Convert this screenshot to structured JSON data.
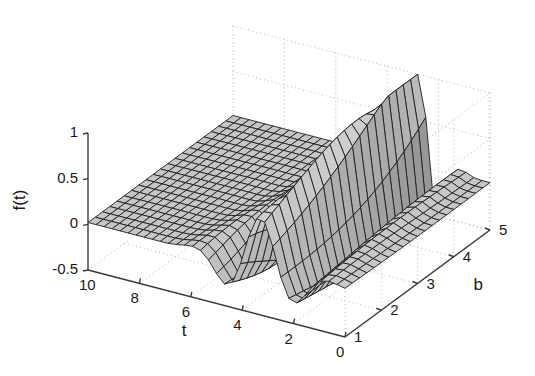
{
  "figure": {
    "background_color": "#ffffff",
    "axis_color": "#3a3a3a",
    "grid_color": "#b4b4b4",
    "mesh_line_color": "#1e1e1e",
    "surface_face_light": "#c9c9c9",
    "surface_face_mid": "#7d7d7d",
    "surface_face_dark": "#4a4a4a"
  },
  "chart_data": {
    "type": "surface",
    "title": "",
    "xlabel": "t",
    "ylabel": "b",
    "zlabel": "f(t)",
    "grid": true,
    "legend": "none",
    "xlim": [
      0,
      10
    ],
    "ylim": [
      1,
      5
    ],
    "zlim": [
      -0.5,
      1
    ],
    "xticks": [
      10,
      8,
      6,
      4,
      2,
      0
    ],
    "xtick_labels": [
      "10",
      "8",
      "6",
      "4",
      "2",
      "0"
    ],
    "yticks": [
      1,
      2,
      3,
      4,
      5
    ],
    "ytick_labels": [
      "1",
      "2",
      "3",
      "4",
      "5"
    ],
    "zticks": [
      -0.5,
      0,
      0.5,
      1
    ],
    "ztick_labels": [
      "-0.5",
      "0",
      "0.5",
      "1"
    ],
    "x_axis_direction": "descending_left_to_right",
    "y_axis_direction": "ascending_front_to_back_right",
    "mesh_nx": 33,
    "mesh_ny": 21,
    "model": {
      "kind": "morlet_like_wavelet",
      "plateau_level": 0.02,
      "center_t_base": 3.3,
      "center_t_slope": -0.12,
      "width_base": 1.25,
      "width_slope": -0.13,
      "amp_base": 0.55,
      "amp_slope": 0.16,
      "freq_base": 2.1,
      "freq_slope": 0.3,
      "phase": 0.0,
      "peak_max": 1.0,
      "trough_min": -0.5
    }
  },
  "axes": {
    "z_ticks": [
      {
        "label": "1",
        "value": 1.0
      },
      {
        "label": "0.5",
        "value": 0.5
      },
      {
        "label": "0",
        "value": 0.0
      },
      {
        "label": "-0.5",
        "value": -0.5
      }
    ],
    "t_ticks": [
      {
        "label": "10",
        "value": 10
      },
      {
        "label": "8",
        "value": 8
      },
      {
        "label": "6",
        "value": 6
      },
      {
        "label": "4",
        "value": 4
      },
      {
        "label": "2",
        "value": 2
      },
      {
        "label": "0",
        "value": 0
      }
    ],
    "b_ticks": [
      {
        "label": "1",
        "value": 1
      },
      {
        "label": "2",
        "value": 2
      },
      {
        "label": "3",
        "value": 3
      },
      {
        "label": "4",
        "value": 4
      },
      {
        "label": "5",
        "value": 5
      }
    ],
    "t_axis_label": "t",
    "b_axis_label": "b",
    "z_axis_label": "f(t)"
  },
  "projection": {
    "origin_x": 88,
    "origin_y": 270,
    "t_axis_end_x": 345,
    "t_axis_end_y": 337,
    "b_axis_end_x": 490,
    "b_axis_end_y": 230,
    "z_top_y": 133,
    "z_bottom_y": 270
  }
}
